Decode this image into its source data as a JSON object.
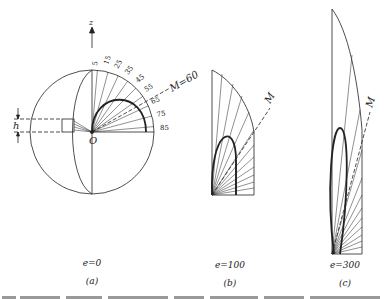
{
  "figure": {
    "panels": [
      {
        "id": "a",
        "label": "(a)",
        "condition": "e=0",
        "axis_label": "z",
        "origin_label": "O",
        "height_label": "h",
        "mach_label": "M=60",
        "angle_labels": [
          "5",
          "15",
          "25",
          "35",
          "45",
          "55",
          "65",
          "75",
          "85"
        ]
      },
      {
        "id": "b",
        "label": "(b)",
        "condition": "e=100",
        "mach_label": "M"
      },
      {
        "id": "c",
        "label": "(c)",
        "condition": "e=300",
        "mach_label": "M"
      }
    ],
    "caption": "Fig. … (caption partially cut off at bottom edge)"
  },
  "colors": {
    "line": "#222222",
    "background": "#ffffff"
  }
}
